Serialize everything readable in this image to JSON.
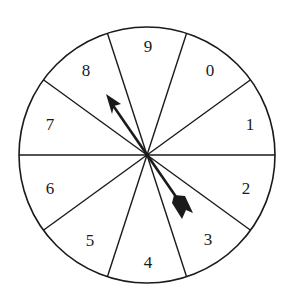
{
  "diagram": {
    "type": "spinner",
    "sector_count": 10,
    "sectors": [
      {
        "label": "9",
        "lx": 148,
        "ly": 52
      },
      {
        "label": "0",
        "lx": 210,
        "ly": 76
      },
      {
        "label": "1",
        "lx": 250,
        "ly": 128
      },
      {
        "label": "2",
        "lx": 246,
        "ly": 194
      },
      {
        "label": "3",
        "lx": 208,
        "ly": 245
      },
      {
        "label": "4",
        "lx": 148,
        "ly": 268
      },
      {
        "label": "5",
        "lx": 90,
        "ly": 246
      },
      {
        "label": "6",
        "lx": 50,
        "ly": 194
      },
      {
        "label": "7",
        "lx": 50,
        "ly": 130
      },
      {
        "label": "8",
        "lx": 86,
        "ly": 76
      }
    ],
    "pointer": {
      "points_to": "8",
      "tail_toward": "3"
    },
    "colors": {
      "stroke": "#1a1a1a",
      "background": "#ffffff"
    }
  }
}
